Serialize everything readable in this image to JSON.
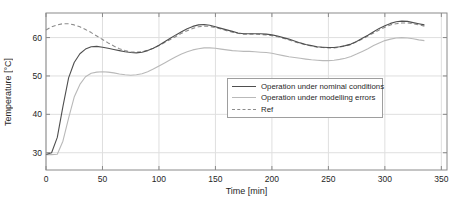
{
  "chart_data": {
    "type": "line",
    "title": "",
    "xlabel": "Time [min]",
    "ylabel": "Temperature [°C]",
    "xlim": [
      0,
      355
    ],
    "ylim": [
      25.5,
      66.4
    ],
    "x_ticks": [
      0,
      50,
      100,
      150,
      200,
      250,
      300,
      350
    ],
    "y_ticks": [
      30,
      40,
      50,
      60
    ],
    "grid": true,
    "legend_position": "middle-right",
    "x": [
      0,
      5,
      10,
      15,
      20,
      25,
      30,
      35,
      40,
      45,
      50,
      55,
      60,
      65,
      70,
      75,
      80,
      85,
      90,
      95,
      100,
      105,
      110,
      115,
      120,
      125,
      130,
      135,
      140,
      145,
      150,
      155,
      160,
      165,
      170,
      175,
      180,
      185,
      190,
      195,
      200,
      205,
      210,
      215,
      220,
      225,
      230,
      235,
      240,
      245,
      250,
      255,
      260,
      265,
      270,
      275,
      280,
      285,
      290,
      295,
      300,
      305,
      310,
      315,
      320,
      325,
      330,
      335
    ],
    "series": [
      {
        "label": "Operation under nominal conditions",
        "color": "#4f4f4f",
        "style": "solid",
        "values": [
          29.5,
          30.0,
          34.0,
          42.0,
          49.5,
          53.5,
          55.8,
          57.0,
          57.6,
          57.7,
          57.5,
          57.2,
          56.9,
          56.6,
          56.3,
          56.1,
          56.0,
          56.2,
          56.6,
          57.2,
          58.0,
          58.9,
          59.8,
          60.7,
          61.5,
          62.3,
          62.9,
          63.3,
          63.4,
          63.2,
          62.8,
          62.4,
          62.0,
          61.6,
          61.2,
          61.0,
          61.0,
          61.0,
          61.0,
          60.9,
          60.7,
          60.4,
          60.0,
          59.6,
          59.1,
          58.6,
          58.2,
          57.9,
          57.6,
          57.5,
          57.4,
          57.4,
          57.6,
          57.9,
          58.3,
          59.0,
          59.8,
          60.6,
          61.5,
          62.4,
          63.1,
          63.7,
          64.1,
          64.3,
          64.2,
          63.9,
          63.6,
          63.3
        ]
      },
      {
        "label": "Operation under modelling errors",
        "color": "#b9b9b9",
        "style": "solid",
        "values": [
          29.5,
          29.5,
          29.6,
          33.0,
          39.0,
          44.5,
          47.8,
          49.8,
          50.7,
          51.0,
          51.1,
          51.0,
          50.8,
          50.5,
          50.3,
          50.2,
          50.3,
          50.6,
          51.1,
          51.8,
          52.6,
          53.4,
          54.2,
          55.0,
          55.7,
          56.3,
          56.8,
          57.1,
          57.3,
          57.3,
          57.2,
          57.0,
          56.8,
          56.6,
          56.5,
          56.4,
          56.4,
          56.3,
          56.2,
          56.1,
          55.9,
          55.6,
          55.3,
          55.0,
          54.8,
          54.6,
          54.4,
          54.2,
          54.1,
          54.0,
          54.0,
          54.1,
          54.3,
          54.6,
          55.1,
          55.7,
          56.4,
          57.1,
          57.9,
          58.6,
          59.2,
          59.6,
          59.9,
          60.0,
          59.9,
          59.7,
          59.4,
          59.2
        ]
      },
      {
        "label": "Ref",
        "color": "#8c8c8c",
        "style": "dashed",
        "values": [
          62.0,
          62.8,
          63.3,
          63.6,
          63.6,
          63.3,
          62.8,
          62.1,
          61.3,
          60.4,
          59.5,
          58.6,
          57.8,
          57.1,
          56.6,
          56.3,
          56.2,
          56.3,
          56.7,
          57.2,
          57.9,
          58.7,
          59.5,
          60.3,
          61.1,
          61.8,
          62.4,
          62.8,
          63.0,
          62.9,
          62.6,
          62.2,
          61.8,
          61.4,
          61.1,
          60.9,
          60.9,
          60.9,
          60.8,
          60.7,
          60.5,
          60.2,
          59.8,
          59.4,
          58.9,
          58.5,
          58.1,
          57.8,
          57.5,
          57.4,
          57.3,
          57.3,
          57.5,
          57.8,
          58.2,
          58.9,
          59.6,
          60.4,
          61.2,
          62.0,
          62.7,
          63.3,
          63.6,
          63.8,
          63.8,
          63.6,
          63.3,
          63.0
        ]
      }
    ],
    "colors": {
      "background": "#ffffff",
      "axis_box": "#8a8a8a",
      "grid": "#dfdfdf",
      "tick_label": "#262626",
      "legend_border": "#9e9e9e"
    }
  }
}
